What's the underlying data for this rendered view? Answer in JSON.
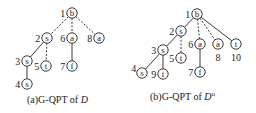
{
  "figures": [
    {
      "id": "a",
      "caption": {
        "prefix": "(a)G-QPT of ",
        "var": "D",
        "sup": ""
      },
      "nodes": [
        {
          "id": 1,
          "label": "b",
          "num": "1",
          "x": 72,
          "y": 13,
          "numSide": "left"
        },
        {
          "id": 2,
          "label": "s",
          "num": "2",
          "x": 47,
          "y": 38,
          "numSide": "left"
        },
        {
          "id": 6,
          "label": "a",
          "num": "6",
          "x": 72,
          "y": 38,
          "numSide": "left"
        },
        {
          "id": 8,
          "label": "a",
          "num": "8",
          "x": 99,
          "y": 38,
          "numSide": "left"
        },
        {
          "id": 3,
          "label": "s",
          "num": "3",
          "x": 27,
          "y": 61,
          "numSide": "left"
        },
        {
          "id": 5,
          "label": "t",
          "num": "5",
          "x": 46,
          "y": 66,
          "numSide": "left"
        },
        {
          "id": 7,
          "label": "f",
          "num": "7",
          "x": 72,
          "y": 66,
          "numSide": "left"
        },
        {
          "id": 4,
          "label": "s",
          "num": "4",
          "x": 27,
          "y": 84,
          "numSide": "left"
        }
      ],
      "edges": [
        {
          "from": 1,
          "to": 2,
          "style": "dashed"
        },
        {
          "from": 1,
          "to": 6,
          "style": "dashed"
        },
        {
          "from": 1,
          "to": 8,
          "style": "dashed"
        },
        {
          "from": 2,
          "to": 3,
          "style": "solid"
        },
        {
          "from": 2,
          "to": 5,
          "style": "dashed"
        },
        {
          "from": 3,
          "to": 4,
          "style": "solid"
        },
        {
          "from": 6,
          "to": 7,
          "style": "solid"
        }
      ]
    },
    {
      "id": "b",
      "caption": {
        "prefix": "(b)G-QPT of ",
        "var": "D",
        "sup": "u"
      },
      "nodes": [
        {
          "id": 1,
          "label": "b",
          "num": "1",
          "x": 197,
          "y": 14,
          "numSide": "left"
        },
        {
          "id": 2,
          "label": "s",
          "num": "2",
          "x": 181,
          "y": 31,
          "numSide": "left"
        },
        {
          "id": 6,
          "label": "a",
          "num": "6",
          "x": 200,
          "y": 44,
          "numSide": "left"
        },
        {
          "id": 8,
          "label": "a",
          "num": "8",
          "x": 218,
          "y": 44,
          "numSide": "below"
        },
        {
          "id": 10,
          "label": "t",
          "num": "10",
          "x": 236,
          "y": 44,
          "numSide": "below"
        },
        {
          "id": 3,
          "label": "s",
          "num": "3",
          "x": 163,
          "y": 50,
          "numSide": "left"
        },
        {
          "id": 5,
          "label": "t",
          "num": "5",
          "x": 181,
          "y": 58,
          "numSide": "left"
        },
        {
          "id": 4,
          "label": "s",
          "num": "4",
          "x": 142,
          "y": 73,
          "numSide": "upleft"
        },
        {
          "id": 9,
          "label": "t",
          "num": "9",
          "x": 163,
          "y": 74,
          "numSide": "left"
        },
        {
          "id": 7,
          "label": "f",
          "num": "7",
          "x": 200,
          "y": 72,
          "numSide": "left"
        }
      ],
      "edges": [
        {
          "from": 1,
          "to": 2,
          "style": "solid"
        },
        {
          "from": 1,
          "to": 6,
          "style": "dashed"
        },
        {
          "from": 1,
          "to": 8,
          "style": "dashed"
        },
        {
          "from": 1,
          "to": 10,
          "style": "solid"
        },
        {
          "from": 2,
          "to": 3,
          "style": "solid"
        },
        {
          "from": 2,
          "to": 5,
          "style": "dashed"
        },
        {
          "from": 3,
          "to": 4,
          "style": "solid"
        },
        {
          "from": 3,
          "to": 9,
          "style": "solid"
        },
        {
          "from": 6,
          "to": 7,
          "style": "solid"
        }
      ]
    }
  ]
}
